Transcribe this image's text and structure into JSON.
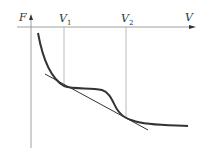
{
  "diagram": {
    "type": "free-energy-vs-volume with common tangent",
    "axes": {
      "y_label": "F",
      "x_label": "V"
    },
    "markers": [
      {
        "label": "V",
        "sub": "1"
      },
      {
        "label": "V",
        "sub": "2"
      }
    ],
    "colors": {
      "curve": "#333333",
      "tangent": "#333333",
      "axes": "#777777",
      "guides": "#999999"
    }
  }
}
